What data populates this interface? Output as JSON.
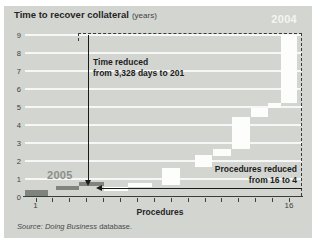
{
  "figure": {
    "title": "Time to recover collateral",
    "title_unit": "(years)",
    "label_2004": "2004",
    "label_2005": "2005",
    "annotation_time": {
      "line1": "Time reduced",
      "line2": "from 3,328 days to 201"
    },
    "annotation_procedures": {
      "line1": "Procedures reduced",
      "line2": "from 16 to 4"
    },
    "xaxis_title": "Procedures",
    "xtick_first": "1",
    "xtick_last": "16",
    "source_italic": "Source: Doing Business",
    "source_rest": " database."
  },
  "colors": {
    "figure_background": "#d3d5d1",
    "bar_2004": "#fdfdfc",
    "bar_2005": "#7f847d",
    "label_2004": "#f4f5f2",
    "label_2005": "#8b9089",
    "gridline": "#eceeea",
    "axis": "#3c3c3c",
    "arrow": "#1a1a1a",
    "text": "#262626"
  },
  "chart_data": {
    "type": "bar",
    "subtype": "waterfall-staircase",
    "xlabel": "Procedures",
    "ylabel": "years",
    "x_axis": {
      "min": 1,
      "max": 16,
      "tick_count": 16,
      "labeled_ticks": [
        1,
        16
      ]
    },
    "y_axis": {
      "min": 0,
      "max": 9,
      "ticks": [
        0,
        1,
        2,
        3,
        4,
        5,
        6,
        7,
        8,
        9
      ]
    },
    "grid": true,
    "legend": "in-plot year labels (2004 top right in dashed region, 2005 at lower left)",
    "key_facts": {
      "time_2004_days": 3328,
      "time_2005_days": 201,
      "procedures_2004": 16,
      "procedures_2005": 4
    },
    "segment_format": [
      "x_start_procedure",
      "x_end_procedure",
      "years_from",
      "years_to"
    ],
    "series": [
      {
        "name": "2004",
        "color": "#fdfdfc",
        "segments": [
          [
            5.05,
            6.5,
            0.33,
            0.58
          ],
          [
            6.5,
            7.9,
            0.56,
            0.78
          ],
          [
            8.5,
            9.55,
            0.67,
            1.6
          ],
          [
            10.45,
            11.45,
            1.67,
            2.33
          ],
          [
            11.5,
            12.55,
            2.28,
            2.67
          ],
          [
            12.6,
            13.7,
            2.67,
            4.44
          ],
          [
            13.75,
            14.75,
            4.44,
            4.94
          ],
          [
            14.75,
            15.5,
            4.94,
            5.22
          ],
          [
            15.5,
            16.5,
            5.22,
            9.0
          ]
        ]
      },
      {
        "name": "2005",
        "color": "#7f847d",
        "segments": [
          [
            0.4,
            1.75,
            0.0,
            0.38
          ],
          [
            2.2,
            3.6,
            0.38,
            0.63
          ],
          [
            3.6,
            5.05,
            0.63,
            0.85
          ]
        ]
      }
    ]
  }
}
